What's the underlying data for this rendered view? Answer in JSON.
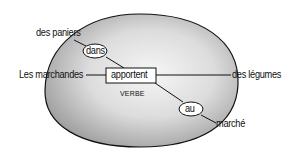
{
  "diagram": {
    "type": "sentence-structure",
    "center": {
      "label": "apportent",
      "category": "VERBE"
    },
    "nodes": [
      {
        "id": "subject",
        "label": "Les marchandes",
        "connects_to": "apportent"
      },
      {
        "id": "object",
        "label": "des légumes",
        "connects_to": "apportent"
      },
      {
        "id": "prep1",
        "label": "dans",
        "connects_to": "apportent",
        "shape": "ellipse"
      },
      {
        "id": "prep1_obj",
        "label": "des paniers",
        "connects_to": "dans"
      },
      {
        "id": "prep2",
        "label": "au",
        "connects_to": "apportent",
        "shape": "ellipse"
      },
      {
        "id": "prep2_obj",
        "label": "marché",
        "connects_to": "au"
      }
    ]
  },
  "labels": {
    "subject": "Les marchandes",
    "verb": "apportent",
    "verb_category": "VERBE",
    "object": "des légumes",
    "prep1": "dans",
    "prep1_obj": "des paniers",
    "prep2": "au",
    "prep2_obj": "marché"
  },
  "colors": {
    "oval_fill_light": "#f4f4f4",
    "oval_fill_dark": "#9a9a9a",
    "stroke": "#111111"
  }
}
